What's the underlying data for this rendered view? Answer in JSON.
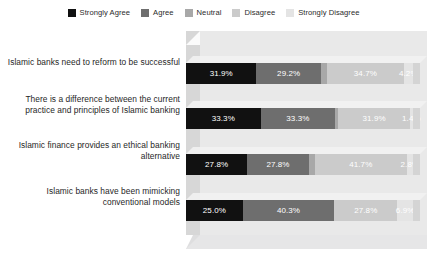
{
  "legend": {
    "position": "top-center",
    "items": [
      {
        "label": "Strongly Agree",
        "color": "#111111"
      },
      {
        "label": "Agree",
        "color": "#6e6e6e"
      },
      {
        "label": "Neutral",
        "color": "#a8a8a8"
      },
      {
        "label": "Disagree",
        "color": "#cbcbcb"
      },
      {
        "label": "Strongly Disagree",
        "color": "#e4e4e4"
      }
    ]
  },
  "footer": {
    "note": ""
  },
  "chart_data": {
    "type": "bar",
    "orientation": "horizontal",
    "stacked": true,
    "stack_mode": "percent",
    "style": "3d",
    "title": "",
    "subtitle": "",
    "xlabel": "",
    "ylabel": "",
    "xlim": [
      0,
      100
    ],
    "grid": false,
    "legend_position": "top-center",
    "categories": [
      "Islamic banks need to reform to be successful",
      "There is a difference between the current practice and principles of Islamic banking",
      "Islamic finance provides an ethical banking alternative",
      "Islamic banks have been mimicking conventional models"
    ],
    "series": [
      {
        "name": "Strongly Agree",
        "color": "#111111",
        "values": [
          31.9,
          33.3,
          27.8,
          25.0
        ]
      },
      {
        "name": "Agree",
        "color": "#6e6e6e",
        "values": [
          29.2,
          33.3,
          27.8,
          40.3
        ]
      },
      {
        "name": "Neutral",
        "color": "#a8a8a8",
        "values": [
          2.8,
          1.4,
          2.8,
          0.0
        ]
      },
      {
        "name": "Disagree",
        "color": "#cbcbcb",
        "values": [
          34.7,
          31.9,
          41.7,
          27.8
        ]
      },
      {
        "name": "Strongly Disagree",
        "color": "#e4e4e4",
        "values": [
          4.2,
          1.4,
          2.8,
          6.9
        ]
      }
    ],
    "rows": [
      {
        "category": "Islamic banks need to reform to be successful",
        "segments": [
          {
            "series": "Strongly Agree",
            "value": 31.9,
            "label": "31.9%",
            "color": "#111111",
            "text_color": "#ffffff",
            "show_label": true
          },
          {
            "series": "Agree",
            "value": 29.2,
            "label": "29.2%",
            "color": "#6e6e6e",
            "text_color": "#ffffff",
            "show_label": true
          },
          {
            "series": "Neutral",
            "value": 2.8,
            "label": "",
            "color": "#a8a8a8",
            "text_color": "#ffffff",
            "show_label": false
          },
          {
            "series": "Disagree",
            "value": 34.7,
            "label": "34.7%",
            "color": "#cbcbcb",
            "text_color": "#ffffff",
            "show_label": true
          },
          {
            "series": "Strongly Disagree",
            "value": 4.2,
            "label": "4.2%",
            "color": "#e4e4e4",
            "text_color": "#ffffff",
            "show_label": true
          }
        ]
      },
      {
        "category": "There is a difference between the current practice and principles of Islamic banking",
        "segments": [
          {
            "series": "Strongly Agree",
            "value": 33.3,
            "label": "33.3%",
            "color": "#111111",
            "text_color": "#ffffff",
            "show_label": true
          },
          {
            "series": "Agree",
            "value": 33.3,
            "label": "33.3%",
            "color": "#6e6e6e",
            "text_color": "#ffffff",
            "show_label": true
          },
          {
            "series": "Neutral",
            "value": 1.4,
            "label": "",
            "color": "#a8a8a8",
            "text_color": "#ffffff",
            "show_label": false
          },
          {
            "series": "Disagree",
            "value": 31.9,
            "label": "31.9%",
            "color": "#cbcbcb",
            "text_color": "#ffffff",
            "show_label": true
          },
          {
            "series": "Strongly Disagree",
            "value": 1.4,
            "label": "1.4%",
            "color": "#e4e4e4",
            "text_color": "#ffffff",
            "show_label": true
          }
        ]
      },
      {
        "category": "Islamic finance provides an ethical banking alternative",
        "segments": [
          {
            "series": "Strongly Agree",
            "value": 27.8,
            "label": "27.8%",
            "color": "#111111",
            "text_color": "#ffffff",
            "show_label": true
          },
          {
            "series": "Agree",
            "value": 27.8,
            "label": "27.8%",
            "color": "#6e6e6e",
            "text_color": "#ffffff",
            "show_label": true
          },
          {
            "series": "Neutral",
            "value": 2.8,
            "label": "",
            "color": "#a8a8a8",
            "text_color": "#ffffff",
            "show_label": false
          },
          {
            "series": "Disagree",
            "value": 41.7,
            "label": "41.7%",
            "color": "#cbcbcb",
            "text_color": "#ffffff",
            "show_label": true
          },
          {
            "series": "Strongly Disagree",
            "value": 2.8,
            "label": "2.8%",
            "color": "#e4e4e4",
            "text_color": "#ffffff",
            "show_label": true
          }
        ]
      },
      {
        "category": "Islamic banks have been mimicking conventional models",
        "segments": [
          {
            "series": "Strongly Agree",
            "value": 25.0,
            "label": "25.0%",
            "color": "#111111",
            "text_color": "#ffffff",
            "show_label": true
          },
          {
            "series": "Agree",
            "value": 40.3,
            "label": "40.3%",
            "color": "#6e6e6e",
            "text_color": "#ffffff",
            "show_label": true
          },
          {
            "series": "Neutral",
            "value": 0.0,
            "label": "",
            "color": "#a8a8a8",
            "text_color": "#ffffff",
            "show_label": false
          },
          {
            "series": "Disagree",
            "value": 27.8,
            "label": "27.8%",
            "color": "#cbcbcb",
            "text_color": "#ffffff",
            "show_label": true
          },
          {
            "series": "Strongly Disagree",
            "value": 6.9,
            "label": "6.9%",
            "color": "#e4e4e4",
            "text_color": "#ffffff",
            "show_label": true
          }
        ]
      }
    ]
  }
}
